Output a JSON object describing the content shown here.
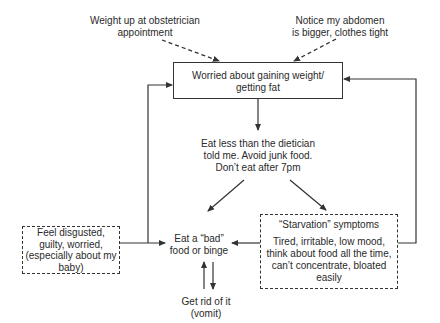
{
  "diagram": {
    "type": "flowchart",
    "nodes": {
      "trigger_left": {
        "lines": [
          "Weight up at obstetrician",
          "appointment"
        ]
      },
      "trigger_right": {
        "lines": [
          "Notice my abdomen",
          "is bigger, clothes tight"
        ]
      },
      "worried": {
        "lines": [
          "Worried about gaining weight/",
          "getting fat"
        ]
      },
      "restrict": {
        "lines": [
          "Eat less than the dietician",
          "told me. Avoid junk food.",
          "Don’t eat after 7pm"
        ]
      },
      "binge": {
        "lines": [
          "Eat a “bad”",
          "food or binge"
        ]
      },
      "starvation": {
        "title": "“Starvation” symptoms",
        "lines": [
          "Tired, irritable, low mood,",
          "think about food all the time,",
          "can’t concentrate, bloated",
          "easily"
        ]
      },
      "feelings": {
        "lines": [
          "Feel disgusted,",
          "guilty, worried,",
          "(especially about my",
          "baby)"
        ]
      },
      "purge": {
        "lines": [
          "Get rid of it",
          "(vomit)"
        ]
      }
    },
    "edges": [
      {
        "from": "trigger_left",
        "to": "worried",
        "style": "dashed"
      },
      {
        "from": "trigger_right",
        "to": "worried",
        "style": "dashed"
      },
      {
        "from": "worried",
        "to": "restrict",
        "style": "solid"
      },
      {
        "from": "restrict",
        "to": "binge",
        "style": "solid"
      },
      {
        "from": "restrict",
        "to": "starvation",
        "style": "solid"
      },
      {
        "from": "starvation",
        "to": "binge",
        "style": "solid"
      },
      {
        "from": "starvation",
        "to": "worried",
        "style": "solid"
      },
      {
        "from": "feelings",
        "to": "worried",
        "style": "solid"
      },
      {
        "from": "feelings",
        "to": "binge",
        "style": "solid"
      },
      {
        "from": "binge",
        "to": "purge",
        "style": "solid"
      },
      {
        "from": "purge",
        "to": "binge",
        "style": "solid"
      }
    ],
    "colors": {
      "line": "#333333",
      "text": "#2a2a2a",
      "background": "#ffffff"
    }
  }
}
